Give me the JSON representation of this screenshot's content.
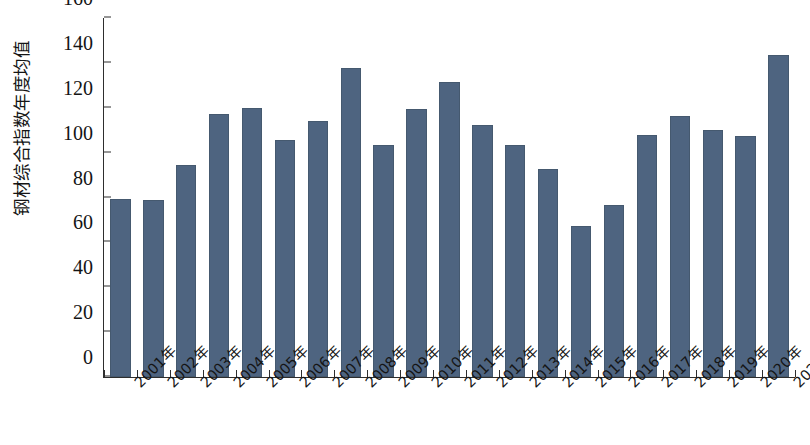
{
  "chart_data": {
    "type": "bar",
    "title": "",
    "subtitle": "",
    "xlabel": "",
    "ylabel": "钢材综合指数年度均值",
    "categories": [
      "2001年",
      "2002年",
      "2003年",
      "2004年",
      "2005年",
      "2006年",
      "2007年",
      "2008年",
      "2009年",
      "2010年",
      "2011年",
      "2012年",
      "2013年",
      "2014年",
      "2015年",
      "2016年",
      "2017年",
      "2018年",
      "2019年",
      "2020年",
      "2021年"
    ],
    "values": [
      79.5,
      78.8,
      94.5,
      117.0,
      120.0,
      105.5,
      114.0,
      137.5,
      103.5,
      119.5,
      131.5,
      112.5,
      103.5,
      92.5,
      67.5,
      76.5,
      108.0,
      116.5,
      110.0,
      107.5,
      143.5
    ],
    "ylim": [
      0,
      160
    ],
    "ytick_values": [
      0,
      20,
      40,
      60,
      80,
      100,
      120,
      140,
      160
    ],
    "ytick_labels": [
      "0",
      "20",
      "40",
      "60",
      "80",
      "100",
      "120",
      "140",
      "160"
    ],
    "grid": false,
    "legend": false,
    "legend_position": "none",
    "bar_color": "#4e6480",
    "axis_color": "#2e2e2e",
    "background_color": "#ffffff"
  }
}
